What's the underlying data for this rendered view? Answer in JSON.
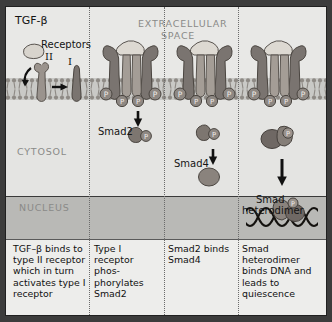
{
  "diagram": {
    "regions": {
      "extracellular_line1": "EXTRACELLULAR",
      "extracellular_line2": "SPACE",
      "cytosol": "CYTOSOL",
      "nucleus": "NUCLEUS"
    },
    "labels": {
      "ligand": "TGF-β",
      "receptors": "Receptors",
      "receptor_II": "II",
      "receptor_I": "I",
      "smad2": "Smad2",
      "smad4": "Smad4",
      "heterodimer_line1": "Smad",
      "heterodimer_line2": "heterodimer",
      "phosphate": "P"
    },
    "panels": [
      {
        "index": 1,
        "caption": "TGF–β binds to\ntype II receptor\nwhich in turn\nactivates type I\nreceptor"
      },
      {
        "index": 2,
        "caption": "Type I\nreceptor\nphos-\nphorylates\nSmad2"
      },
      {
        "index": 3,
        "caption": "Smad2 binds\nSmad4"
      },
      {
        "index": 4,
        "caption": "Smad\nheterodimer\nbinds DNA and\nleads to\nquiescence"
      }
    ],
    "colors": {
      "extracellular_bg": "#e8e8e6",
      "membrane_bg": "#c9c9c6",
      "cytosol_bg": "#e4e4e2",
      "nucleus_bg": "#b9b9b6",
      "caption_bg": "#ededeb",
      "protein_dark": "#7a7470",
      "protein_mid": "#9a938d",
      "protein_light": "#b4ada6",
      "ligand_fill": "#d8d4cd",
      "outline": "#4a4540",
      "text_dark": "#141414",
      "text_muted": "#8a8a88"
    }
  }
}
